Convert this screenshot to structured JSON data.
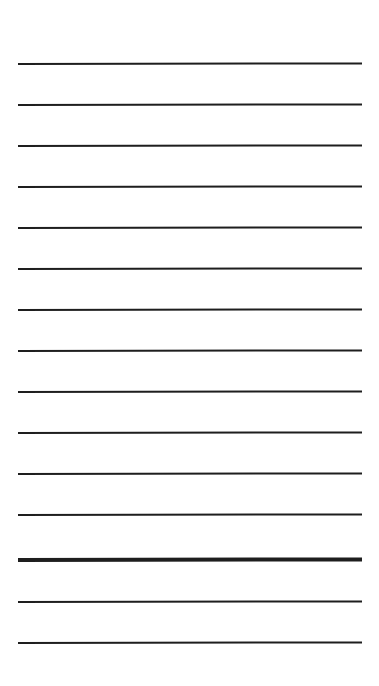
{
  "page": {
    "background": "#ffffff",
    "line_color": "#1e1e1e"
  },
  "lines": [
    {
      "y": 63,
      "thickness": 2
    },
    {
      "y": 104,
      "thickness": 2
    },
    {
      "y": 145,
      "thickness": 2
    },
    {
      "y": 186,
      "thickness": 2
    },
    {
      "y": 227,
      "thickness": 2
    },
    {
      "y": 268,
      "thickness": 2
    },
    {
      "y": 309,
      "thickness": 2
    },
    {
      "y": 350,
      "thickness": 2
    },
    {
      "y": 391,
      "thickness": 2
    },
    {
      "y": 432,
      "thickness": 2
    },
    {
      "y": 473,
      "thickness": 2
    },
    {
      "y": 514,
      "thickness": 2
    },
    {
      "y": 558,
      "thickness": 4
    },
    {
      "y": 601,
      "thickness": 2
    },
    {
      "y": 642,
      "thickness": 2
    }
  ]
}
